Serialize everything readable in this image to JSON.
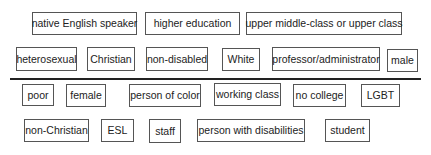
{
  "diagram": {
    "type": "privilege-vs-marginalized-identity-tags",
    "groups": [
      {
        "name": "privileged",
        "position": "above-divider",
        "rows": [
          [
            "native English speaker",
            "higher education",
            "upper middle-class or upper class"
          ],
          [
            "heterosexual",
            "Christian",
            "non-disabled",
            "White",
            "professor/administrator",
            "male"
          ]
        ]
      },
      {
        "name": "marginalized",
        "position": "below-divider",
        "rows": [
          [
            "poor",
            "female",
            "person of color",
            "working class",
            "no college",
            "LGBT"
          ],
          [
            "non-Christian",
            "ESL",
            "staff",
            "person with disabilities",
            "student"
          ]
        ]
      }
    ]
  },
  "tags": {
    "native_english_speaker": "native English speaker",
    "higher_education": "higher education",
    "upper_class": "upper middle-class or upper class",
    "heterosexual": "heterosexual",
    "christian": "Christian",
    "non_disabled": "non-disabled",
    "white": "White",
    "professor_administrator": "professor/administrator",
    "male": "male",
    "poor": "poor",
    "female": "female",
    "person_of_color": "person of color",
    "working_class": "working class",
    "no_college": "no college",
    "lgbt": "LGBT",
    "non_christian": "non-Christian",
    "esl": "ESL",
    "staff": "staff",
    "person_with_disabilities": "person with disabilities",
    "student": "student"
  },
  "colors": {
    "border": "#555555",
    "text": "#222222",
    "divider": "#222222",
    "background": "#ffffff"
  }
}
